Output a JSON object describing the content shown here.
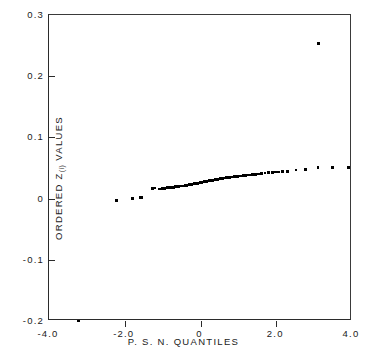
{
  "figure": {
    "background": "#ffffff",
    "marker_color": "#000000",
    "axis_color": "#2b2b2b"
  },
  "axes": {
    "x_title": "P. S. N. QUANTILES",
    "y_title_prefix": "ORDERED Z",
    "y_title_subscript": "(i)",
    "y_title_suffix": " VALUES",
    "x_tick_labels": [
      "-4.0",
      "-2.0",
      "0",
      "2.0",
      "4.0"
    ],
    "y_tick_labels": [
      "0.3",
      "0.2",
      "0.1",
      "0",
      "-0.1",
      "-0.2"
    ]
  },
  "chart_data": {
    "type": "scatter",
    "title": "",
    "xlabel": "P. S. N. QUANTILES",
    "ylabel": "ORDERED Z(i) VALUES",
    "xlim": [
      -4.0,
      4.0
    ],
    "ylim": [
      -0.2,
      0.3
    ],
    "xticks": [
      -4.0,
      -2.0,
      0.0,
      2.0,
      4.0
    ],
    "yticks": [
      -0.2,
      -0.1,
      0.0,
      0.1,
      0.2,
      0.3
    ],
    "grid": false,
    "legend": null,
    "annotations": [
      {
        "label": "low outlier",
        "x": -3.22,
        "y": -0.2
      },
      {
        "label": "high outlier",
        "x": 3.12,
        "y": 0.253
      }
    ],
    "series": [
      {
        "name": "Ordered Z(i) values vs. P.S.N. quantiles",
        "marker": "square",
        "points": [
          [
            -3.22,
            -0.2
          ],
          [
            -2.21,
            -0.003
          ],
          [
            -1.8,
            0.0005
          ],
          [
            -1.58,
            0.002
          ],
          [
            -1.55,
            0.0022
          ],
          [
            -1.26,
            0.0168
          ],
          [
            -1.2,
            0.0172
          ],
          [
            -1.08,
            0.016
          ],
          [
            -1.02,
            0.0162
          ],
          [
            -0.95,
            0.0165
          ],
          [
            -0.88,
            0.0178
          ],
          [
            -0.82,
            0.018
          ],
          [
            -0.76,
            0.0182
          ],
          [
            -0.7,
            0.0184
          ],
          [
            -0.66,
            0.0196
          ],
          [
            -0.63,
            0.0198
          ],
          [
            -0.6,
            0.02
          ],
          [
            -0.57,
            0.0201
          ],
          [
            -0.55,
            0.0203
          ],
          [
            -0.52,
            0.0204
          ],
          [
            -0.5,
            0.0205
          ],
          [
            -0.48,
            0.0206
          ],
          [
            -0.46,
            0.0207
          ],
          [
            -0.44,
            0.0208
          ],
          [
            -0.42,
            0.0209
          ],
          [
            -0.4,
            0.0212
          ],
          [
            -0.38,
            0.0215
          ],
          [
            -0.36,
            0.0218
          ],
          [
            -0.34,
            0.022
          ],
          [
            -0.32,
            0.0222
          ],
          [
            -0.3,
            0.0224
          ],
          [
            -0.29,
            0.0226
          ],
          [
            -0.27,
            0.0228
          ],
          [
            -0.26,
            0.023
          ],
          [
            -0.24,
            0.0232
          ],
          [
            -0.23,
            0.0234
          ],
          [
            -0.21,
            0.0236
          ],
          [
            -0.2,
            0.0238
          ],
          [
            -0.18,
            0.024
          ],
          [
            -0.17,
            0.0242
          ],
          [
            -0.15,
            0.0244
          ],
          [
            -0.14,
            0.0245
          ],
          [
            -0.12,
            0.0246
          ],
          [
            -0.11,
            0.0248
          ],
          [
            -0.09,
            0.025
          ],
          [
            -0.08,
            0.0251
          ],
          [
            -0.07,
            0.0252
          ],
          [
            -0.05,
            0.0254
          ],
          [
            -0.04,
            0.0256
          ],
          [
            -0.02,
            0.0258
          ],
          [
            -0.01,
            0.026
          ],
          [
            0.01,
            0.0262
          ],
          [
            0.02,
            0.0264
          ],
          [
            0.04,
            0.0266
          ],
          [
            0.05,
            0.0268
          ],
          [
            0.07,
            0.027
          ],
          [
            0.08,
            0.0272
          ],
          [
            0.1,
            0.0274
          ],
          [
            0.11,
            0.0276
          ],
          [
            0.13,
            0.0278
          ],
          [
            0.14,
            0.028
          ],
          [
            0.16,
            0.0282
          ],
          [
            0.17,
            0.0284
          ],
          [
            0.19,
            0.0286
          ],
          [
            0.21,
            0.0288
          ],
          [
            0.22,
            0.029
          ],
          [
            0.24,
            0.0292
          ],
          [
            0.26,
            0.0294
          ],
          [
            0.27,
            0.0296
          ],
          [
            0.29,
            0.0298
          ],
          [
            0.31,
            0.03
          ],
          [
            0.33,
            0.0302
          ],
          [
            0.35,
            0.0304
          ],
          [
            0.37,
            0.0306
          ],
          [
            0.39,
            0.0308
          ],
          [
            0.41,
            0.031
          ],
          [
            0.43,
            0.0313
          ],
          [
            0.45,
            0.0316
          ],
          [
            0.48,
            0.0319
          ],
          [
            0.5,
            0.0322
          ],
          [
            0.53,
            0.0325
          ],
          [
            0.55,
            0.0328
          ],
          [
            0.58,
            0.0331
          ],
          [
            0.61,
            0.0334
          ],
          [
            0.64,
            0.0337
          ],
          [
            0.67,
            0.034
          ],
          [
            0.7,
            0.0343
          ],
          [
            0.74,
            0.0346
          ],
          [
            0.77,
            0.0349
          ],
          [
            0.81,
            0.0352
          ],
          [
            0.85,
            0.0355
          ],
          [
            0.89,
            0.0358
          ],
          [
            0.93,
            0.0361
          ],
          [
            0.98,
            0.0364
          ],
          [
            1.03,
            0.0368
          ],
          [
            1.08,
            0.0372
          ],
          [
            1.13,
            0.0376
          ],
          [
            1.19,
            0.038
          ],
          [
            1.25,
            0.0384
          ],
          [
            1.31,
            0.0388
          ],
          [
            1.38,
            0.0392
          ],
          [
            1.45,
            0.0398
          ],
          [
            1.53,
            0.0404
          ],
          [
            1.61,
            0.041
          ],
          [
            1.7,
            0.0416
          ],
          [
            1.8,
            0.0422
          ],
          [
            1.9,
            0.0428
          ],
          [
            1.98,
            0.0432
          ],
          [
            2.06,
            0.0436
          ],
          [
            2.16,
            0.044
          ],
          [
            2.3,
            0.0442
          ],
          [
            2.52,
            0.047
          ],
          [
            2.78,
            0.0478
          ],
          [
            3.1,
            0.0505
          ],
          [
            3.48,
            0.0508
          ],
          [
            3.9,
            0.0512
          ],
          [
            3.12,
            0.253
          ]
        ]
      }
    ]
  }
}
